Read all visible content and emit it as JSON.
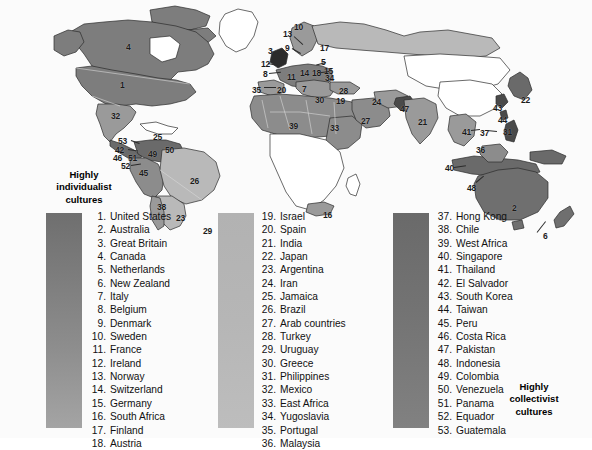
{
  "figure": {
    "type": "map",
    "heading_left": "Highly\nindividualist\ncultures",
    "heading_left_lines": [
      "Highly",
      "individualist",
      "cultures"
    ],
    "heading_right_lines": [
      "Highly",
      "collectivist",
      "cultures"
    ],
    "scale_bars": [
      {
        "name": "individualist-bar",
        "from": "#6f6f6f",
        "to": "#a4a4a4"
      },
      {
        "name": "middle-bar",
        "from": "#b2b2b2",
        "to": "#bdbdbd"
      },
      {
        "name": "collectivist-bar",
        "from": "#6a6a6a",
        "to": "#818181"
      }
    ]
  },
  "legend": {
    "columns": [
      {
        "name": "legend-column-1",
        "items": [
          {
            "n": "1.",
            "t": "United States"
          },
          {
            "n": "2.",
            "t": "Australia"
          },
          {
            "n": "3.",
            "t": "Great Britain"
          },
          {
            "n": "4.",
            "t": "Canada"
          },
          {
            "n": "5.",
            "t": "Netherlands"
          },
          {
            "n": "6.",
            "t": "New Zealand"
          },
          {
            "n": "7.",
            "t": "Italy"
          },
          {
            "n": "8.",
            "t": "Belgium"
          },
          {
            "n": "9.",
            "t": "Denmark"
          },
          {
            "n": "10.",
            "t": "Sweden"
          },
          {
            "n": "11.",
            "t": "France"
          },
          {
            "n": "12.",
            "t": "Ireland"
          },
          {
            "n": "13.",
            "t": "Norway"
          },
          {
            "n": "14.",
            "t": "Switzerland"
          },
          {
            "n": "15.",
            "t": "Germany"
          },
          {
            "n": "16.",
            "t": "South Africa"
          },
          {
            "n": "17.",
            "t": "Finland"
          },
          {
            "n": "18.",
            "t": "Austria"
          }
        ]
      },
      {
        "name": "legend-column-2",
        "items": [
          {
            "n": "19.",
            "t": "Israel"
          },
          {
            "n": "20.",
            "t": "Spain"
          },
          {
            "n": "21.",
            "t": "India"
          },
          {
            "n": "22.",
            "t": "Japan"
          },
          {
            "n": "23.",
            "t": "Argentina"
          },
          {
            "n": "24.",
            "t": "Iran"
          },
          {
            "n": "25.",
            "t": "Jamaica"
          },
          {
            "n": "26.",
            "t": "Brazil"
          },
          {
            "n": "27.",
            "t": "Arab countries"
          },
          {
            "n": "28.",
            "t": "Turkey"
          },
          {
            "n": "29.",
            "t": "Uruguay"
          },
          {
            "n": "30.",
            "t": "Greece"
          },
          {
            "n": "31.",
            "t": "Philippines"
          },
          {
            "n": "32.",
            "t": "Mexico"
          },
          {
            "n": "33.",
            "t": "East Africa"
          },
          {
            "n": "34.",
            "t": "Yugoslavia"
          },
          {
            "n": "35.",
            "t": "Portugal"
          },
          {
            "n": "36.",
            "t": "Malaysia"
          }
        ]
      },
      {
        "name": "legend-column-3",
        "items": [
          {
            "n": "37.",
            "t": "Hong Kong"
          },
          {
            "n": "38.",
            "t": "Chile"
          },
          {
            "n": "39.",
            "t": "West Africa"
          },
          {
            "n": "40.",
            "t": "Singapore"
          },
          {
            "n": "41.",
            "t": "Thailand"
          },
          {
            "n": "42.",
            "t": "El Salvador"
          },
          {
            "n": "43.",
            "t": "South Korea"
          },
          {
            "n": "44.",
            "t": "Taiwan"
          },
          {
            "n": "45.",
            "t": "Peru"
          },
          {
            "n": "46.",
            "t": "Costa Rica"
          },
          {
            "n": "47.",
            "t": "Pakistan"
          },
          {
            "n": "48.",
            "t": "Indonesia"
          },
          {
            "n": "49.",
            "t": "Colombia"
          },
          {
            "n": "50.",
            "t": "Venezuela"
          },
          {
            "n": "51.",
            "t": "Panama"
          },
          {
            "n": "52.",
            "t": "Equador"
          },
          {
            "n": "53.",
            "t": "Guatemala"
          }
        ]
      }
    ]
  },
  "map_labels": [
    {
      "id": "4",
      "x": 126,
      "y": 43
    },
    {
      "id": "1",
      "x": 120,
      "y": 81
    },
    {
      "id": "32",
      "x": 111,
      "y": 112
    },
    {
      "id": "25",
      "x": 153,
      "y": 133
    },
    {
      "id": "53",
      "x": 118,
      "y": 137
    },
    {
      "id": "42",
      "x": 115,
      "y": 146
    },
    {
      "id": "46",
      "x": 113,
      "y": 154
    },
    {
      "id": "51",
      "x": 128,
      "y": 154
    },
    {
      "id": "49",
      "x": 148,
      "y": 150
    },
    {
      "id": "50",
      "x": 165,
      "y": 146
    },
    {
      "id": "52",
      "x": 121,
      "y": 162
    },
    {
      "id": "45",
      "x": 139,
      "y": 169
    },
    {
      "id": "26",
      "x": 190,
      "y": 177
    },
    {
      "id": "38",
      "x": 157,
      "y": 203
    },
    {
      "id": "23",
      "x": 176,
      "y": 214
    },
    {
      "id": "29",
      "x": 203,
      "y": 227
    },
    {
      "id": "10",
      "x": 294,
      "y": 23
    },
    {
      "id": "13",
      "x": 283,
      "y": 30
    },
    {
      "id": "9",
      "x": 285,
      "y": 44
    },
    {
      "id": "3",
      "x": 268,
      "y": 47
    },
    {
      "id": "12",
      "x": 261,
      "y": 60
    },
    {
      "id": "8",
      "x": 263,
      "y": 70
    },
    {
      "id": "17",
      "x": 320,
      "y": 44
    },
    {
      "id": "5",
      "x": 321,
      "y": 58
    },
    {
      "id": "15",
      "x": 324,
      "y": 67
    },
    {
      "id": "11",
      "x": 287,
      "y": 73
    },
    {
      "id": "14",
      "x": 300,
      "y": 69
    },
    {
      "id": "18",
      "x": 312,
      "y": 69
    },
    {
      "id": "34",
      "x": 325,
      "y": 74
    },
    {
      "id": "35",
      "x": 252,
      "y": 86
    },
    {
      "id": "20",
      "x": 277,
      "y": 86
    },
    {
      "id": "7",
      "x": 302,
      "y": 85
    },
    {
      "id": "28",
      "x": 339,
      "y": 87
    },
    {
      "id": "30",
      "x": 315,
      "y": 96
    },
    {
      "id": "19",
      "x": 336,
      "y": 97
    },
    {
      "id": "24",
      "x": 372,
      "y": 98
    },
    {
      "id": "27",
      "x": 361,
      "y": 117
    },
    {
      "id": "39",
      "x": 289,
      "y": 122
    },
    {
      "id": "33",
      "x": 330,
      "y": 124
    },
    {
      "id": "47",
      "x": 400,
      "y": 105
    },
    {
      "id": "21",
      "x": 418,
      "y": 118
    },
    {
      "id": "16",
      "x": 323,
      "y": 211
    },
    {
      "id": "22",
      "x": 521,
      "y": 96
    },
    {
      "id": "43",
      "x": 493,
      "y": 104
    },
    {
      "id": "44",
      "x": 498,
      "y": 116
    },
    {
      "id": "37",
      "x": 480,
      "y": 129
    },
    {
      "id": "31",
      "x": 503,
      "y": 128
    },
    {
      "id": "41",
      "x": 462,
      "y": 128
    },
    {
      "id": "36",
      "x": 476,
      "y": 146
    },
    {
      "id": "40",
      "x": 445,
      "y": 164
    },
    {
      "id": "48",
      "x": 467,
      "y": 184
    },
    {
      "id": "2",
      "x": 512,
      "y": 204
    },
    {
      "id": "6",
      "x": 543,
      "y": 232
    }
  ],
  "colors": {
    "land_dark": "#7d7d7d",
    "land_mid": "#9a9a9a",
    "land_light": "#b9b9b9",
    "land_white": "#ffffff",
    "outline": "#2b2b2b"
  }
}
